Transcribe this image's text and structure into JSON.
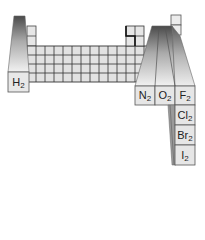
{
  "diagram": {
    "colors": {
      "cell_fill": "#e4e4e4",
      "grid_line": "#333333",
      "column_top": "#555555",
      "column_bottom": "#f0f0f0"
    },
    "elements": [
      {
        "id": "h2",
        "symbol": "H",
        "subscript": "2"
      },
      {
        "id": "n2",
        "symbol": "N",
        "subscript": "2"
      },
      {
        "id": "o2",
        "symbol": "O",
        "subscript": "2"
      },
      {
        "id": "f2",
        "symbol": "F",
        "subscript": "2"
      },
      {
        "id": "cl2",
        "symbol": "Cl",
        "subscript": "2"
      },
      {
        "id": "br2",
        "symbol": "Br",
        "subscript": "2"
      },
      {
        "id": "i2",
        "symbol": "I",
        "subscript": "2"
      }
    ]
  }
}
